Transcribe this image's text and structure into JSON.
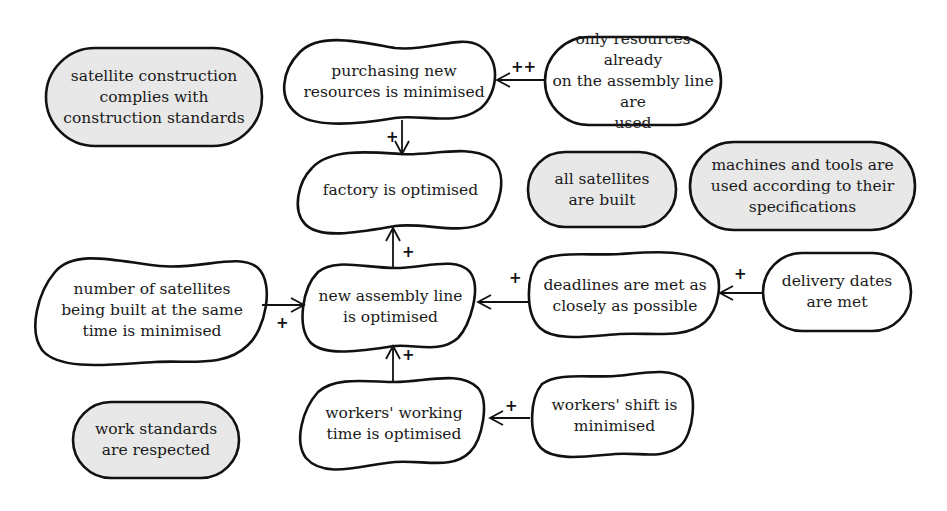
{
  "diagram": {
    "type": "goal-model",
    "nodes": {
      "n_standards": {
        "label": "satellite construction\ncomplies with\nconstruction standards",
        "style": "grey-rounded"
      },
      "n_purchasing": {
        "label": "purchasing new\nresources is minimised",
        "style": "cloud"
      },
      "n_only_resources": {
        "label": "only resources already\non the assembly line are\nused",
        "style": "white-rounded"
      },
      "n_factory": {
        "label": "factory is optimised",
        "style": "cloud"
      },
      "n_all_satellites": {
        "label": "all satellites\nare built",
        "style": "grey-rounded"
      },
      "n_machines": {
        "label": "machines and tools are\nused according to their\nspecifications",
        "style": "grey-rounded"
      },
      "n_number": {
        "label": "number of satellites\nbeing built at the same\ntime is minimised",
        "style": "cloud"
      },
      "n_assembly": {
        "label": "new assembly line\nis optimised",
        "style": "cloud"
      },
      "n_deadlines": {
        "label": "deadlines are met as\nclosely as possible",
        "style": "cloud"
      },
      "n_delivery": {
        "label": "delivery dates\nare met",
        "style": "white-rounded"
      },
      "n_work_standards": {
        "label": "work standards\nare respected",
        "style": "grey-rounded"
      },
      "n_working_time": {
        "label": "workers' working\ntime is optimised",
        "style": "cloud"
      },
      "n_shift": {
        "label": "workers' shift is\nminimised",
        "style": "cloud"
      }
    },
    "edges": [
      {
        "from": "n_only_resources",
        "to": "n_purchasing",
        "label": "++"
      },
      {
        "from": "n_purchasing",
        "to": "n_factory",
        "label": "+"
      },
      {
        "from": "n_assembly",
        "to": "n_factory",
        "label": "+"
      },
      {
        "from": "n_number",
        "to": "n_assembly",
        "label": "+"
      },
      {
        "from": "n_deadlines",
        "to": "n_assembly",
        "label": "+"
      },
      {
        "from": "n_delivery",
        "to": "n_deadlines",
        "label": "+"
      },
      {
        "from": "n_working_time",
        "to": "n_assembly",
        "label": "+"
      },
      {
        "from": "n_shift",
        "to": "n_working_time",
        "label": "+"
      }
    ],
    "edge_labels": {
      "e1": "++",
      "e2": "+",
      "e3": "+",
      "e4": "+",
      "e5": "+",
      "e6": "+",
      "e7": "+",
      "e8": "+"
    },
    "colors": {
      "grey_fill": "#e8e8e8",
      "white_fill": "#ffffff",
      "stroke": "#111111"
    }
  }
}
